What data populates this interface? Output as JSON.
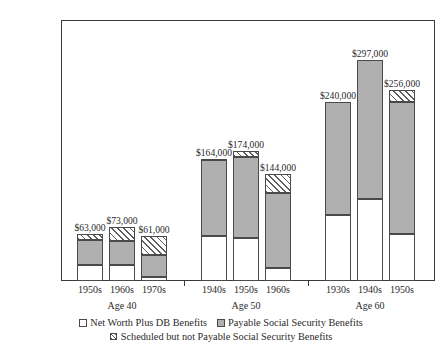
{
  "chart_data": {
    "type": "bar",
    "stacked": true,
    "title": "",
    "subtitle": "",
    "xlabel": "",
    "ylabel": "",
    "ylim": [
      0,
      350000
    ],
    "ytick_labels": [
      "$0",
      "$50,000",
      "$100,000",
      "$150,000",
      "$200,000",
      "$250,000",
      "$300,000",
      "$350,000"
    ],
    "ytick_values": [
      0,
      50000,
      100000,
      150000,
      200000,
      250000,
      300000,
      350000
    ],
    "grid": false,
    "legend_position": "bottom",
    "series": [
      {
        "name": "Net Worth Plus DB Benefits",
        "key": "net",
        "color": "#ffffff",
        "values": [
          22000,
          22000,
          5000,
          60000,
          58000,
          17000,
          89000,
          110000,
          63000
        ]
      },
      {
        "name": "Payable Social Security Benefits",
        "key": "payable",
        "color": "#b0b0b0",
        "values": [
          33000,
          32000,
          30000,
          102000,
          108000,
          101000,
          151000,
          187000,
          177000
        ]
      },
      {
        "name": "Scheduled but not Payable Social Security Benefits",
        "key": "scheduled",
        "color": "hatch",
        "values": [
          8000,
          19000,
          26000,
          2000,
          8000,
          26000,
          0,
          0,
          16000
        ]
      }
    ],
    "groups": [
      {
        "label": "Age 40",
        "categories": [
          "1950s",
          "1960s",
          "1970s"
        ],
        "totals": [
          63000,
          73000,
          61000
        ],
        "total_labels": [
          "$63,000",
          "$73,000",
          "$61,000"
        ]
      },
      {
        "label": "Age 50",
        "categories": [
          "1940s",
          "1950s",
          "1960s"
        ],
        "totals": [
          164000,
          174000,
          144000
        ],
        "total_labels": [
          "$164,000",
          "$174,000",
          "$144,000"
        ]
      },
      {
        "label": "Age 60",
        "categories": [
          "1930s",
          "1940s",
          "1950s"
        ],
        "totals": [
          240000,
          297000,
          256000
        ],
        "total_labels": [
          "$240,000",
          "$297,000",
          "$256,000"
        ]
      }
    ],
    "bars": [
      {
        "group": "Age 40",
        "category": "1950s",
        "net": 22000,
        "payable": 33000,
        "scheduled": 8000,
        "total": 63000,
        "total_label": "$63,000"
      },
      {
        "group": "Age 40",
        "category": "1960s",
        "net": 22000,
        "payable": 32000,
        "scheduled": 19000,
        "total": 73000,
        "total_label": "$73,000"
      },
      {
        "group": "Age 40",
        "category": "1970s",
        "net": 5000,
        "payable": 30000,
        "scheduled": 26000,
        "total": 61000,
        "total_label": "$61,000"
      },
      {
        "group": "Age 50",
        "category": "1940s",
        "net": 60000,
        "payable": 102000,
        "scheduled": 2000,
        "total": 164000,
        "total_label": "$164,000"
      },
      {
        "group": "Age 50",
        "category": "1950s",
        "net": 58000,
        "payable": 108000,
        "scheduled": 8000,
        "total": 174000,
        "total_label": "$174,000"
      },
      {
        "group": "Age 50",
        "category": "1960s",
        "net": 17000,
        "payable": 101000,
        "scheduled": 26000,
        "total": 144000,
        "total_label": "$144,000"
      },
      {
        "group": "Age 60",
        "category": "1930s",
        "net": 89000,
        "payable": 151000,
        "scheduled": 0,
        "total": 240000,
        "total_label": "$240,000"
      },
      {
        "group": "Age 60",
        "category": "1940s",
        "net": 110000,
        "payable": 187000,
        "scheduled": 0,
        "total": 297000,
        "total_label": "$297,000"
      },
      {
        "group": "Age 60",
        "category": "1950s",
        "net": 63000,
        "payable": 177000,
        "scheduled": 16000,
        "total": 256000,
        "total_label": "$256,000"
      }
    ],
    "legend": [
      {
        "label": "Net Worth Plus DB Benefits",
        "key": "net"
      },
      {
        "label": "Payable Social Security Benefits",
        "key": "payable"
      },
      {
        "label": "Scheduled but not Payable Social Security Benefits",
        "key": "scheduled"
      }
    ]
  }
}
